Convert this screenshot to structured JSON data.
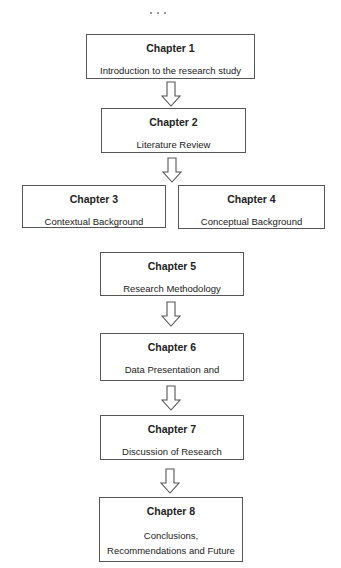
{
  "diagram": {
    "type": "flowchart",
    "nodes": [
      {
        "id": "ch1",
        "title": "Chapter 1",
        "desc": "Introduction to the research study"
      },
      {
        "id": "ch2",
        "title": "Chapter 2",
        "desc": "Literature Review"
      },
      {
        "id": "ch3",
        "title": "Chapter 3",
        "desc": "Contextual Background"
      },
      {
        "id": "ch4",
        "title": "Chapter 4",
        "desc": "Conceptual Background"
      },
      {
        "id": "ch5",
        "title": "Chapter 5",
        "desc": "Research Methodology"
      },
      {
        "id": "ch6",
        "title": "Chapter 6",
        "desc": "Data Presentation and"
      },
      {
        "id": "ch7",
        "title": "Chapter 7",
        "desc": "Discussion of Research"
      },
      {
        "id": "ch8",
        "title": "Chapter 8",
        "desc_line1": "Conclusions,",
        "desc_line2": "Recommendations and Future"
      }
    ],
    "edges": [
      {
        "from": "ch1",
        "to": "ch2"
      },
      {
        "from": "ch2",
        "to": "ch3/ch4"
      },
      {
        "from": "ch5",
        "to": "ch6"
      },
      {
        "from": "ch6",
        "to": "ch7"
      },
      {
        "from": "ch7",
        "to": "ch8"
      }
    ],
    "colors": {
      "border": "#555555",
      "text": "#222222",
      "background": "#ffffff"
    }
  }
}
